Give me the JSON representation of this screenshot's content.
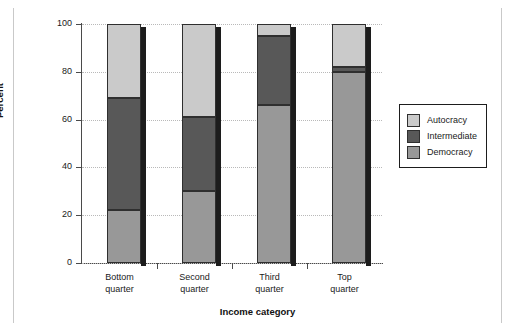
{
  "chart_data": {
    "type": "bar",
    "subtype": "stacked-percentage",
    "title": "",
    "xlabel": "Income category",
    "ylabel": "Percent",
    "categories": [
      "Bottom quarter",
      "Second quarter",
      "Third quarter",
      "Top quarter"
    ],
    "category_lines": [
      [
        "Bottom",
        "quarter"
      ],
      [
        "Second",
        "quarter"
      ],
      [
        "Third",
        "quarter"
      ],
      [
        "Top",
        "quarter"
      ]
    ],
    "series": [
      {
        "name": "Democracy",
        "color": "#989898",
        "values": [
          22,
          30,
          66,
          80
        ]
      },
      {
        "name": "Intermediate",
        "color": "#585858",
        "values": [
          47,
          31,
          29,
          2
        ]
      },
      {
        "name": "Autocracy",
        "color": "#cacaca",
        "values": [
          31,
          39,
          5,
          18
        ]
      }
    ],
    "cumulative_tops": [
      {
        "category": "Bottom quarter",
        "democracy_top": 22,
        "intermediate_top": 69,
        "autocracy_top": 100
      },
      {
        "category": "Second quarter",
        "democracy_top": 30,
        "intermediate_top": 61,
        "autocracy_top": 100
      },
      {
        "category": "Third quarter",
        "democracy_top": 66,
        "intermediate_top": 95,
        "autocracy_top": 100
      },
      {
        "category": "Top quarter",
        "democracy_top": 80,
        "intermediate_top": 82,
        "autocracy_top": 100
      }
    ],
    "ylim": [
      0,
      100
    ],
    "yticks": [
      0,
      20,
      40,
      60,
      80,
      100
    ],
    "ytick_labels": [
      "0",
      "20",
      "40",
      "60",
      "80",
      "100"
    ],
    "grid": true,
    "grid_style": "dotted-horizontal",
    "legend": {
      "position": "right",
      "entries": [
        {
          "label": "Autocracy",
          "color": "#cacaca"
        },
        {
          "label": "Intermediate",
          "color": "#585858"
        },
        {
          "label": "Democracy",
          "color": "#989898"
        }
      ]
    }
  }
}
